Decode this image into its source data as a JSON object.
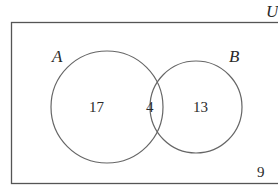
{
  "diagram": {
    "type": "venn",
    "universe_label": "U",
    "sets": [
      {
        "label": "A",
        "only_count": "17"
      },
      {
        "label": "B",
        "only_count": "13"
      }
    ],
    "intersection_count": "4",
    "outside_count": "9",
    "colors": {
      "stroke": "#555555",
      "text": "#2a2a2a",
      "background": "#ffffff"
    }
  }
}
